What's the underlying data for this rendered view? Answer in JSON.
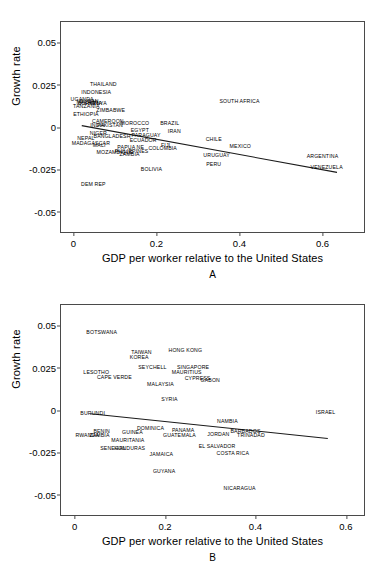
{
  "figure": {
    "axis_color": "#4a4a4a",
    "line_color": "#1a1a1a",
    "text_color": "#000000"
  },
  "chart_data": [
    {
      "type": "scatter",
      "panel": "A",
      "title": "",
      "xlabel": "GDP per worker relative to the United States",
      "ylabel": "Growth rate",
      "xlim": [
        -0.03,
        0.7
      ],
      "ylim": [
        -0.062,
        0.062
      ],
      "xticks": [
        "0",
        "0.2",
        "0.4",
        "0.6"
      ],
      "xtick_values": [
        0,
        0.2,
        0.4,
        0.6
      ],
      "yticks": [
        "0.05",
        "0.025",
        "0",
        "-0.025",
        "-0.05"
      ],
      "ytick_values": [
        0.05,
        0.025,
        0,
        -0.025,
        -0.05
      ],
      "grid": false,
      "legend": "none",
      "marker": "text-label",
      "trendline": {
        "x0": 0.02,
        "y0": 0.0008,
        "x1": 0.635,
        "y1": -0.0268
      },
      "points": [
        {
          "label": "THAILAND",
          "x": 0.072,
          "y": 0.025
        },
        {
          "label": "INDONESIA",
          "x": 0.055,
          "y": 0.0198
        },
        {
          "label": "UGANDA",
          "x": 0.021,
          "y": 0.016
        },
        {
          "label": "SUDAN",
          "x": 0.038,
          "y": 0.0148
        },
        {
          "label": "MALAWI",
          "x": 0.033,
          "y": 0.014
        },
        {
          "label": "BURKINA",
          "x": 0.04,
          "y": 0.0138
        },
        {
          "label": "KENYA",
          "x": 0.059,
          "y": 0.0133
        },
        {
          "label": "TANZANIA",
          "x": 0.031,
          "y": 0.012
        },
        {
          "label": "SOUTH AFRICA",
          "x": 0.4,
          "y": 0.0148
        },
        {
          "label": "ZIMBABWE",
          "x": 0.09,
          "y": 0.0095
        },
        {
          "label": "ETHIOPIA",
          "x": 0.03,
          "y": 0.0068
        },
        {
          "label": "CAMEROON",
          "x": 0.083,
          "y": 0.003
        },
        {
          "label": "INDIA",
          "x": 0.058,
          "y": 0.0005
        },
        {
          "label": "PAKISTAN",
          "x": 0.088,
          "y": 0.0008
        },
        {
          "label": "MOROCCO",
          "x": 0.148,
          "y": 0.0015
        },
        {
          "label": "BRAZIL",
          "x": 0.232,
          "y": 0.002
        },
        {
          "label": "EGYPT",
          "x": 0.16,
          "y": -0.0025
        },
        {
          "label": "IRAN",
          "x": 0.243,
          "y": -0.0032
        },
        {
          "label": "NIGER",
          "x": 0.06,
          "y": -0.0042
        },
        {
          "label": "BANGLADESH",
          "x": 0.093,
          "y": -0.006
        },
        {
          "label": "PARAGUAY",
          "x": 0.175,
          "y": -0.0055
        },
        {
          "label": "NEPAL",
          "x": 0.03,
          "y": -0.0068
        },
        {
          "label": "ECUADOR",
          "x": 0.168,
          "y": -0.008
        },
        {
          "label": "CHILE",
          "x": 0.338,
          "y": -0.0078
        },
        {
          "label": "MADAGASCAR",
          "x": 0.042,
          "y": -0.0098
        },
        {
          "label": "MALI",
          "x": 0.062,
          "y": -0.0112
        },
        {
          "label": "FIJI",
          "x": 0.222,
          "y": -0.011
        },
        {
          "label": "MEXICO",
          "x": 0.402,
          "y": -0.012
        },
        {
          "label": "PAPUA NE",
          "x": 0.138,
          "y": -0.0122
        },
        {
          "label": "COLOMBIA",
          "x": 0.215,
          "y": -0.0132
        },
        {
          "label": "PHILIPPINES",
          "x": 0.14,
          "y": -0.015
        },
        {
          "label": "MOZAMBIQUE",
          "x": 0.1,
          "y": -0.0155
        },
        {
          "label": "ZAMBIA",
          "x": 0.135,
          "y": -0.0168
        },
        {
          "label": "URUGUAY",
          "x": 0.345,
          "y": -0.0172
        },
        {
          "label": "ARGENTINA",
          "x": 0.6,
          "y": -0.018
        },
        {
          "label": "PERU",
          "x": 0.338,
          "y": -0.0222
        },
        {
          "label": "VENEZUELA",
          "x": 0.61,
          "y": -0.024
        },
        {
          "label": "BOLIVIA",
          "x": 0.188,
          "y": -0.0252
        },
        {
          "label": "DEM REP",
          "x": 0.048,
          "y": -0.034
        }
      ]
    },
    {
      "type": "scatter",
      "panel": "B",
      "title": "",
      "xlabel": "GDP per worker relative to the United States",
      "ylabel": "Growth rate",
      "xlim": [
        -0.03,
        0.64
      ],
      "ylim": [
        -0.062,
        0.062
      ],
      "xticks": [
        "0",
        "0.2",
        "0.4",
        "0.6"
      ],
      "xtick_values": [
        0,
        0.2,
        0.4,
        0.6
      ],
      "yticks": [
        "0.05",
        "0.025",
        "0",
        "-0.025",
        "-0.05"
      ],
      "ytick_values": [
        0.05,
        0.025,
        0,
        -0.025,
        -0.05
      ],
      "grid": false,
      "legend": "none",
      "marker": "text-label",
      "trendline": {
        "x0": 0.035,
        "y0": -0.0022,
        "x1": 0.56,
        "y1": -0.0168
      },
      "points": [
        {
          "label": "BOTSWANA",
          "x": 0.06,
          "y": 0.0452
        },
        {
          "label": "TAIWAN",
          "x": 0.148,
          "y": 0.0338
        },
        {
          "label": "HONG KONG",
          "x": 0.245,
          "y": 0.035
        },
        {
          "label": "KOREA",
          "x": 0.143,
          "y": 0.031
        },
        {
          "label": "SEYCHELL",
          "x": 0.172,
          "y": 0.025
        },
        {
          "label": "SINGAPORE",
          "x": 0.262,
          "y": 0.025
        },
        {
          "label": "LESOTHO",
          "x": 0.048,
          "y": 0.022
        },
        {
          "label": "MAURITIUS",
          "x": 0.248,
          "y": 0.0218
        },
        {
          "label": "CAPE VERDE",
          "x": 0.088,
          "y": 0.019
        },
        {
          "label": "CYPRESS",
          "x": 0.272,
          "y": 0.0182
        },
        {
          "label": "GABON",
          "x": 0.3,
          "y": 0.0172
        },
        {
          "label": "MALAYSIA",
          "x": 0.19,
          "y": 0.015
        },
        {
          "label": "SYRIA",
          "x": 0.21,
          "y": 0.0062
        },
        {
          "label": "BURUNDI",
          "x": 0.04,
          "y": -0.0022
        },
        {
          "label": "ISRAEL",
          "x": 0.555,
          "y": -0.002
        },
        {
          "label": "NAMBIA",
          "x": 0.338,
          "y": -0.0068
        },
        {
          "label": "DOMINICA",
          "x": 0.168,
          "y": -0.011
        },
        {
          "label": "PANAMA",
          "x": 0.24,
          "y": -0.0122
        },
        {
          "label": "BARBADOS",
          "x": 0.378,
          "y": -0.013
        },
        {
          "label": "BENIN",
          "x": 0.06,
          "y": -0.013
        },
        {
          "label": "GUINEA",
          "x": 0.128,
          "y": -0.0135
        },
        {
          "label": "JORDAN",
          "x": 0.318,
          "y": -0.0145
        },
        {
          "label": "RWANDA",
          "x": 0.028,
          "y": -0.0152
        },
        {
          "label": "ZAMBIA",
          "x": 0.055,
          "y": -0.0155
        },
        {
          "label": "GUATEMALA",
          "x": 0.232,
          "y": -0.0155
        },
        {
          "label": "TRINADAD",
          "x": 0.39,
          "y": -0.0155
        },
        {
          "label": "MAURITANIA",
          "x": 0.118,
          "y": -0.0182
        },
        {
          "label": "EL SALVADOR",
          "x": 0.315,
          "y": -0.0218
        },
        {
          "label": "SENEGAL",
          "x": 0.085,
          "y": -0.023
        },
        {
          "label": "HONDURAS",
          "x": 0.122,
          "y": -0.023
        },
        {
          "label": "COSTA RICA",
          "x": 0.35,
          "y": -0.0258
        },
        {
          "label": "JAMAICA",
          "x": 0.192,
          "y": -0.0268
        },
        {
          "label": "GUYANA",
          "x": 0.198,
          "y": -0.0368
        },
        {
          "label": "NICARAGUA",
          "x": 0.365,
          "y": -0.0468
        }
      ]
    }
  ]
}
